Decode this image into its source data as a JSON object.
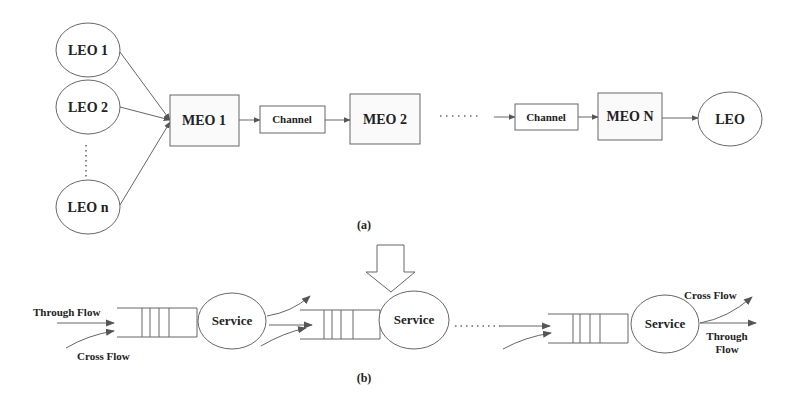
{
  "diagram_a": {
    "caption": "(a)",
    "leo_sources": [
      {
        "label": "LEO 1"
      },
      {
        "label": "LEO 2"
      },
      {
        "label": "LEO n"
      }
    ],
    "vertical_ellipsis": "⋮",
    "chain": [
      {
        "type": "meo",
        "label": "MEO 1"
      },
      {
        "type": "channel",
        "label": "Channel"
      },
      {
        "type": "meo",
        "label": "MEO 2"
      },
      {
        "type": "ellipsis",
        "label": "......."
      },
      {
        "type": "channel",
        "label": "Channel"
      },
      {
        "type": "meo",
        "label": "MEO N"
      },
      {
        "type": "leo",
        "label": "LEO"
      }
    ]
  },
  "diagram_b": {
    "caption": "(b)",
    "stage1": {
      "input_through_label": "Through Flow",
      "input_cross_label": "Cross Flow",
      "service_label": "Service"
    },
    "stage2": {
      "service_label": "Service",
      "highlight_arrow": "down-arrow"
    },
    "ellipsis": ".......",
    "stage3": {
      "service_label": "Service",
      "output_cross_label": "Cross Flow",
      "output_through_label_line1": "Through",
      "output_through_label_line2": "Flow"
    }
  },
  "colors": {
    "stroke": "#666666",
    "text": "#222222",
    "arrow_fill": "#555555",
    "background": "#ffffff"
  }
}
